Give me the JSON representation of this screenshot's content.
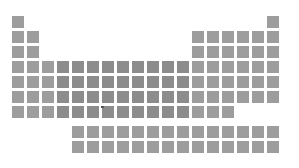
{
  "title": "",
  "layout": {
    "origin_x": 12,
    "origin_y": 16,
    "pitch": 15,
    "cell_size": 12,
    "fblock_origin_y": 126
  },
  "colors": {
    "background": "#ffffff",
    "cell": "#9d9d9d",
    "cell_dark": "#8c8c8c"
  },
  "rows": [
    {
      "period": 1,
      "cols": [
        0,
        17
      ]
    },
    {
      "period": 2,
      "cols": [
        0,
        1,
        12,
        13,
        14,
        15,
        16,
        17
      ]
    },
    {
      "period": 3,
      "cols": [
        0,
        1,
        12,
        13,
        14,
        15,
        16,
        17
      ]
    },
    {
      "period": 4,
      "cols": [
        0,
        1,
        2,
        3,
        4,
        5,
        6,
        7,
        8,
        9,
        10,
        11,
        12,
        13,
        14,
        15,
        16,
        17
      ]
    },
    {
      "period": 5,
      "cols": [
        0,
        1,
        2,
        3,
        4,
        5,
        6,
        7,
        8,
        9,
        10,
        11,
        12,
        13,
        14,
        15,
        16,
        17
      ]
    },
    {
      "period": 6,
      "cols": [
        0,
        1,
        2,
        3,
        4,
        5,
        6,
        7,
        8,
        9,
        10,
        11,
        12,
        13,
        14,
        15,
        16,
        17
      ]
    },
    {
      "period": 7,
      "cols": [
        0,
        1,
        2,
        3,
        4,
        5,
        6,
        7,
        8,
        9,
        10,
        11,
        12,
        13,
        14
      ]
    }
  ],
  "fblock_rows": [
    {
      "series": "lanthanides",
      "cols": [
        4,
        5,
        6,
        7,
        8,
        9,
        10,
        11,
        12,
        13,
        14,
        15,
        16,
        17
      ]
    },
    {
      "series": "actinides",
      "cols": [
        4,
        5,
        6,
        7,
        8,
        9,
        10,
        11,
        12,
        13,
        14,
        15,
        16,
        17
      ]
    }
  ],
  "dark_cols": [
    3,
    4,
    5,
    6,
    7,
    8,
    9,
    10,
    11
  ]
}
